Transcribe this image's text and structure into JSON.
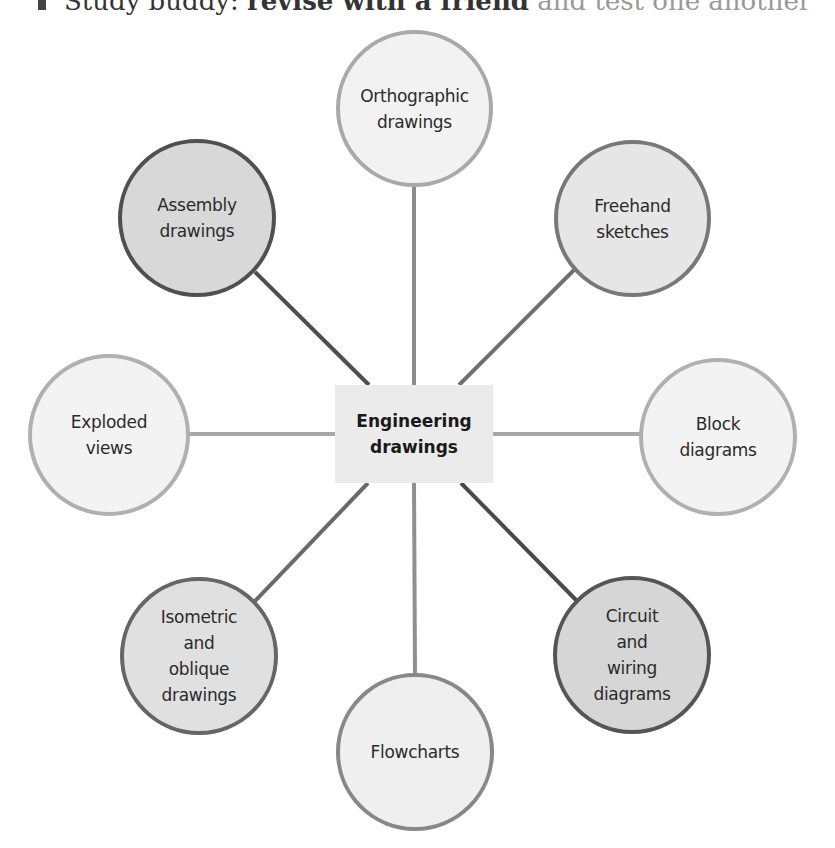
{
  "header": {
    "text_start": "Study buddy: ",
    "text_bold": "revise with a friend",
    "text_faded": " and test one another"
  },
  "diagram": {
    "center": {
      "label": "Engineering\ndrawings"
    },
    "nodes": [
      {
        "id": "orthographic",
        "label": "Orthographic\ndrawings"
      },
      {
        "id": "freehand",
        "label": "Freehand\nsketches"
      },
      {
        "id": "block",
        "label": "Block\ndiagrams"
      },
      {
        "id": "circuit",
        "label": "Circuit\nand\nwiring\ndiagrams"
      },
      {
        "id": "flowcharts",
        "label": "Flowcharts"
      },
      {
        "id": "isometric",
        "label": "Isometric\nand\noblique\ndrawings"
      },
      {
        "id": "exploded",
        "label": "Exploded\nviews"
      },
      {
        "id": "assembly",
        "label": "Assembly\ndrawings"
      }
    ]
  },
  "colors": {
    "light_border": "#acacac",
    "mid_border": "#7a7a7a",
    "dark_border": "#555555",
    "center_fill": "#ebebeb"
  }
}
